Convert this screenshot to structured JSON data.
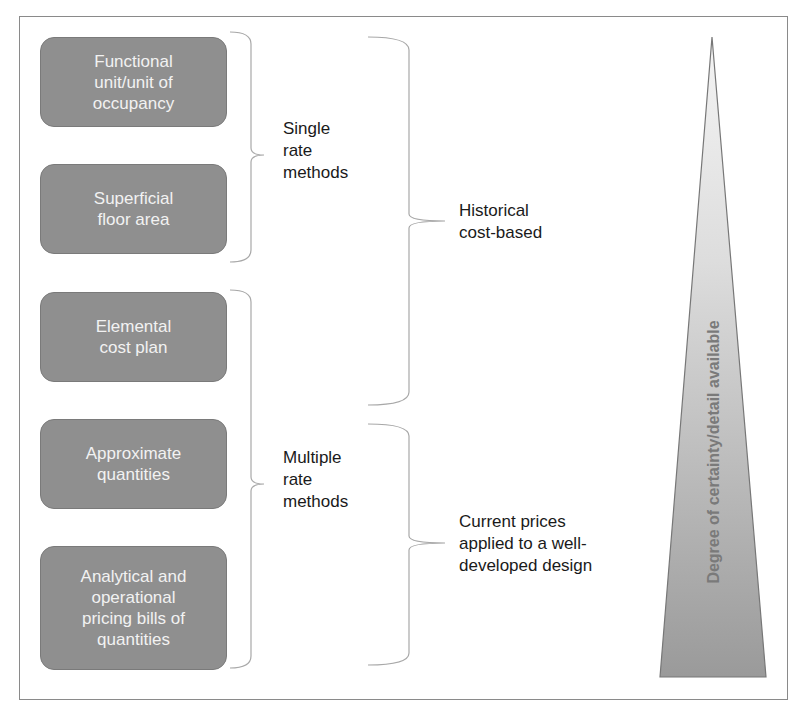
{
  "boxes": [
    {
      "label": "Functional\nunit/unit of\noccupancy"
    },
    {
      "label": "Superficial\nfloor area"
    },
    {
      "label": "Elemental\ncost plan"
    },
    {
      "label": "Approximate\nquantities"
    },
    {
      "label": "Analytical and\noperational\npricing bills of\nquantities"
    }
  ],
  "groups": {
    "single_rate": "Single\nrate\nmethods",
    "multiple_rate": "Multiple\nrate\nmethods",
    "historical": "Historical\ncost-based",
    "current": "Current prices\napplied to a well-\ndeveloped design"
  },
  "wedge": {
    "label": "Degree of certainty/detail available",
    "colors": {
      "top": "#f4f4f4",
      "bottom": "#9a9a9a",
      "stroke": "#777777"
    }
  },
  "colors": {
    "box_fill": "#8f8f8f",
    "box_text": "#f2f2f2",
    "bracket": "#a8a8a8"
  }
}
